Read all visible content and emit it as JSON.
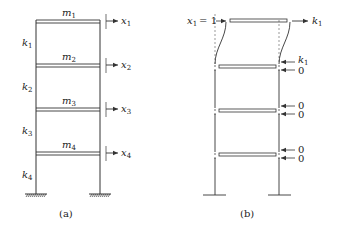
{
  "figure_a": {
    "caption": "(a)",
    "masses": [
      {
        "symbol": "m",
        "sub": "1"
      },
      {
        "symbol": "m",
        "sub": "2"
      },
      {
        "symbol": "m",
        "sub": "3"
      },
      {
        "symbol": "m",
        "sub": "4"
      }
    ],
    "stiffnesses": [
      {
        "symbol": "k",
        "sub": "1"
      },
      {
        "symbol": "k",
        "sub": "2"
      },
      {
        "symbol": "k",
        "sub": "3"
      },
      {
        "symbol": "k",
        "sub": "4"
      }
    ],
    "displacements": [
      {
        "symbol": "x",
        "sub": "1"
      },
      {
        "symbol": "x",
        "sub": "2"
      },
      {
        "symbol": "x",
        "sub": "3"
      },
      {
        "symbol": "x",
        "sub": "4"
      }
    ]
  },
  "figure_b": {
    "caption": "(b)",
    "imposed_displacement": {
      "symbol": "x",
      "sub": "1",
      "value": "= 1"
    },
    "top_force": {
      "symbol": "k",
      "sub": "1"
    },
    "floor2_forces": [
      {
        "symbol": "k",
        "sub": "1"
      },
      {
        "value": "0"
      }
    ],
    "floor3_forces": [
      {
        "value": "0"
      },
      {
        "value": "0"
      }
    ],
    "floor4_forces": [
      {
        "value": "0"
      },
      {
        "value": "0"
      }
    ]
  },
  "colors": {
    "line": "#333333",
    "text": "#222222",
    "dashed": "#555555"
  }
}
